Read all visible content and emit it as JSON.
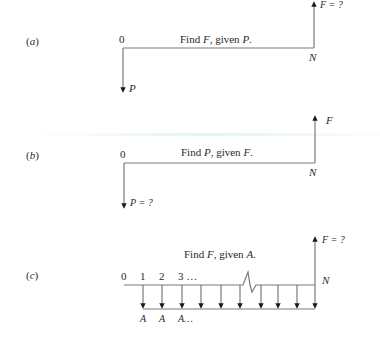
{
  "diagrams": [
    {
      "id": "a",
      "panel_label": "(a)",
      "caption": "Find F, given P.",
      "caption_parts": [
        "Find ",
        "F",
        ", given ",
        "P",
        "."
      ],
      "start_label": "0",
      "end_label": "N",
      "down_arrow_label": "P",
      "up_arrow_label": "F = ?"
    },
    {
      "id": "b",
      "panel_label": "(b)",
      "caption": "Find P, given F.",
      "caption_parts": [
        "Find ",
        "P",
        ", given ",
        "F",
        "."
      ],
      "start_label": "0",
      "end_label": "N",
      "down_arrow_label": "P = ?",
      "up_arrow_label": "F"
    },
    {
      "id": "c",
      "panel_label": "(c)",
      "caption": "Find F, given A.",
      "caption_parts": [
        "Find ",
        "F",
        ", given ",
        "A",
        "."
      ],
      "period_labels": [
        "0",
        "1",
        "2",
        "3 …"
      ],
      "end_label": "N",
      "up_arrow_label": "F = ?",
      "annuity_labels": [
        "A",
        "A",
        "A…"
      ],
      "annuity_arrow_count": 10
    }
  ],
  "colors": {
    "line": "#7a7a7a",
    "arrowhead": "#1a1a1a",
    "text": "#2a2a2a"
  }
}
